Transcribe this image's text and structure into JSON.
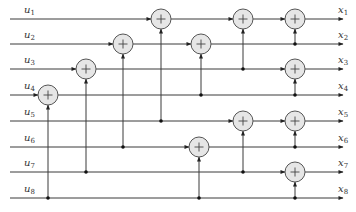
{
  "diagram": {
    "type": "butterfly-adder-network",
    "colors": {
      "wire": "#3a3a3a",
      "node_fill": "#e6e6e6",
      "node_stroke": "#555555",
      "dot": "#111111"
    },
    "inputs": [
      {
        "label": "u",
        "sub": "1",
        "y": 19
      },
      {
        "label": "u",
        "sub": "2",
        "y": 44
      },
      {
        "label": "u",
        "sub": "3",
        "y": 69
      },
      {
        "label": "u",
        "sub": "4",
        "y": 95
      },
      {
        "label": "u",
        "sub": "5",
        "y": 121
      },
      {
        "label": "u",
        "sub": "6",
        "y": 147
      },
      {
        "label": "u",
        "sub": "7",
        "y": 172
      },
      {
        "label": "u",
        "sub": "8",
        "y": 198
      }
    ],
    "outputs": [
      {
        "label": "x",
        "sub": "1"
      },
      {
        "label": "x",
        "sub": "2"
      },
      {
        "label": "x",
        "sub": "3"
      },
      {
        "label": "x",
        "sub": "4"
      },
      {
        "label": "x",
        "sub": "5"
      },
      {
        "label": "x",
        "sub": "6"
      },
      {
        "label": "x",
        "sub": "7"
      },
      {
        "label": "x",
        "sub": "8"
      }
    ],
    "adders": [
      {
        "row": 4,
        "x": 48,
        "from_row": 8,
        "symbol": "+"
      },
      {
        "row": 3,
        "x": 86,
        "from_row": 7,
        "symbol": "+"
      },
      {
        "row": 2,
        "x": 123,
        "from_row": 6,
        "symbol": "+"
      },
      {
        "row": 1,
        "x": 161,
        "from_row": 5,
        "symbol": "+"
      },
      {
        "row": 2,
        "x": 201,
        "from_row": 4,
        "symbol": "+"
      },
      {
        "row": 1,
        "x": 243,
        "from_row": 3,
        "symbol": "+"
      },
      {
        "row": 6,
        "x": 199,
        "from_row": 8,
        "symbol": "+"
      },
      {
        "row": 5,
        "x": 243,
        "from_row": 7,
        "symbol": "+"
      },
      {
        "row": 1,
        "x": 295,
        "from_row": 2,
        "symbol": "+"
      },
      {
        "row": 3,
        "x": 295,
        "from_row": 4,
        "symbol": "+"
      },
      {
        "row": 5,
        "x": 295,
        "from_row": 6,
        "symbol": "+"
      },
      {
        "row": 7,
        "x": 295,
        "from_row": 8,
        "symbol": "+"
      }
    ]
  }
}
